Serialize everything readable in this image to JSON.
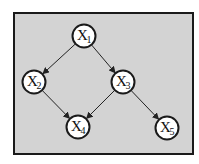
{
  "diagram": {
    "type": "directed-acyclic-graph",
    "colors": {
      "background": "#d3d3d3",
      "border": "#1a1a1a",
      "node_fill": "#ffffff",
      "edge": "#222222"
    },
    "nodes": [
      {
        "id": "x1",
        "base": "X",
        "sub": "1",
        "cx": 84,
        "cy": 36
      },
      {
        "id": "x2",
        "base": "X",
        "sub": "2",
        "cx": 34,
        "cy": 82
      },
      {
        "id": "x3",
        "base": "X",
        "sub": "3",
        "cx": 123,
        "cy": 82
      },
      {
        "id": "x4",
        "base": "X",
        "sub": "4",
        "cx": 78,
        "cy": 127
      },
      {
        "id": "x5",
        "base": "X",
        "sub": "5",
        "cx": 167,
        "cy": 128
      }
    ],
    "edges": [
      {
        "from": "x1",
        "to": "x2"
      },
      {
        "from": "x1",
        "to": "x3"
      },
      {
        "from": "x2",
        "to": "x4"
      },
      {
        "from": "x3",
        "to": "x4"
      },
      {
        "from": "x3",
        "to": "x5"
      }
    ]
  }
}
